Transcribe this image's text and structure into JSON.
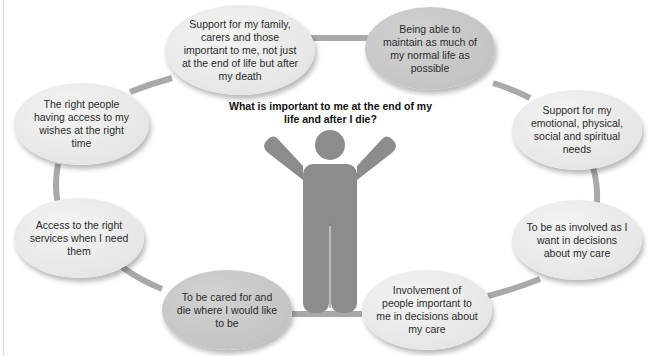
{
  "diagram": {
    "title": "What is important to me at the end of my life and after I die?",
    "center_figure": "person-arms-raised-icon",
    "colors": {
      "ring": "#a9a9a9",
      "figure": "#8c8c8c",
      "bubble_light": "#e6e6e6",
      "bubble_dark": "#c4c4c4",
      "text": "#2a2a2a"
    },
    "bubbles": [
      {
        "id": "family-support",
        "text": "Support for my family, carers and those important to me, not just at the end of life but after my death",
        "shade": "light"
      },
      {
        "id": "normal-life",
        "text": "Being able to maintain as much of my normal life as possible",
        "shade": "dark"
      },
      {
        "id": "holistic-support",
        "text": "Support for my emotional, physical, social and spiritual needs",
        "shade": "light"
      },
      {
        "id": "involved-decisions",
        "text": "To be as involved as I want in decisions about my care",
        "shade": "light"
      },
      {
        "id": "people-involvement",
        "text": "Involvement of people important to me in decisions about my care",
        "shade": "light"
      },
      {
        "id": "cared-for",
        "text": "To be cared for and die where I would like to be",
        "shade": "dark"
      },
      {
        "id": "right-services",
        "text": "Access to the right services when I need them",
        "shade": "light"
      },
      {
        "id": "right-people",
        "text": "The right people having access to my wishes at the right time",
        "shade": "light"
      }
    ]
  }
}
